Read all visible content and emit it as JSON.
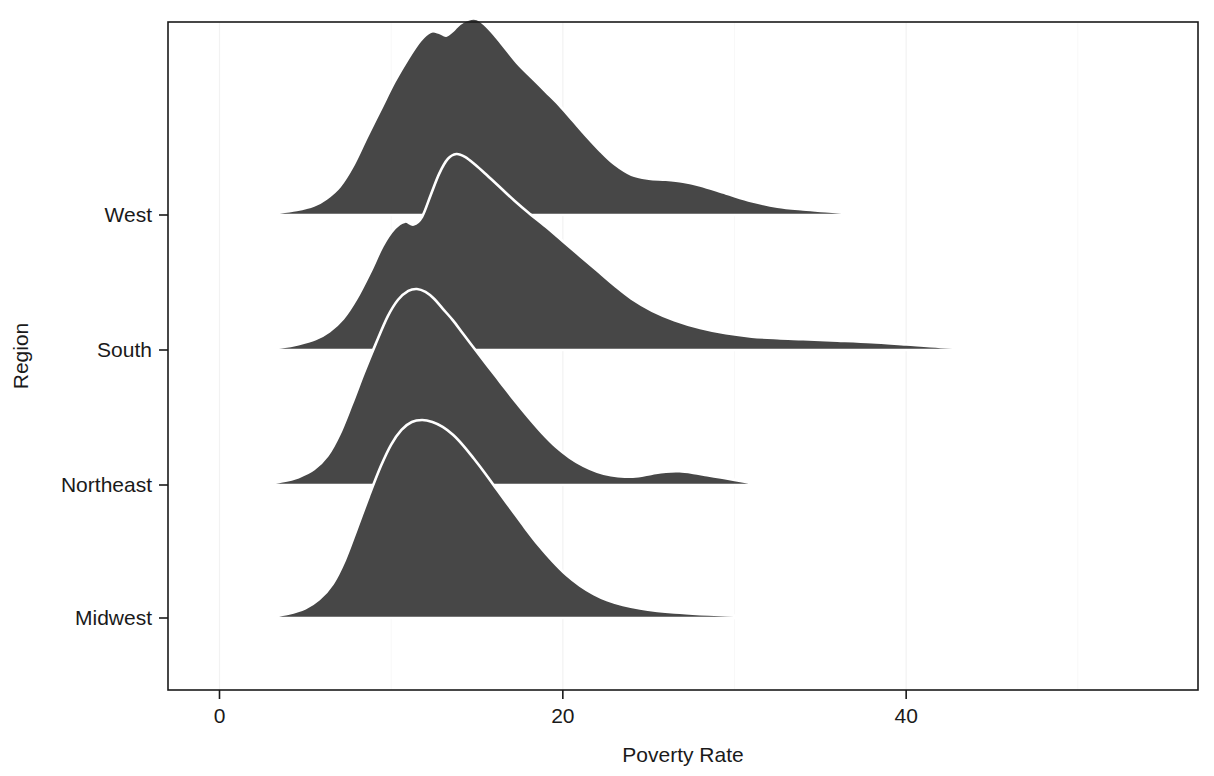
{
  "chart_data": {
    "type": "area",
    "subtype": "ridgeline-joyplot",
    "title": "",
    "xlabel": "Poverty Rate",
    "ylabel": "Region",
    "xlim": [
      -3,
      57
    ],
    "x_ticks": [
      0,
      20,
      40
    ],
    "x_tick_labels": [
      "0",
      "20",
      "40"
    ],
    "x_minor_ticks": [
      10,
      30,
      50
    ],
    "grid": "minor-light",
    "legend": "none",
    "categories": [
      "Midwest",
      "Northeast",
      "South",
      "West"
    ],
    "category_order_top_to_bottom": [
      "West",
      "South",
      "Northeast",
      "Midwest"
    ],
    "fill_color": "#474747",
    "line_color": "#ffffff",
    "background_color": "#ffffff",
    "panel_border_color": "#1a1a1a",
    "series": [
      {
        "name": "West",
        "x": [
          2.4,
          3.5,
          4.5,
          5.5,
          6.2,
          7.0,
          7.8,
          8.6,
          9.4,
          10.2,
          11.0,
          11.7,
          12.3,
          12.8,
          13.2,
          13.6,
          14.0,
          14.5,
          15.0,
          15.4,
          16.0,
          16.7,
          17.4,
          18.2,
          19.0,
          19.8,
          20.6,
          21.4,
          22.2,
          23.0,
          24.0,
          25.0,
          26.0,
          27.0,
          28.0,
          29.5,
          31.0,
          32.5,
          34.0,
          35.5,
          37.0
        ],
        "density": [
          0.006,
          0.013,
          0.025,
          0.048,
          0.082,
          0.145,
          0.255,
          0.4,
          0.54,
          0.68,
          0.8,
          0.89,
          0.935,
          0.93,
          0.915,
          0.94,
          0.975,
          0.998,
          1.0,
          0.975,
          0.92,
          0.845,
          0.77,
          0.7,
          0.63,
          0.56,
          0.48,
          0.4,
          0.325,
          0.26,
          0.205,
          0.185,
          0.18,
          0.17,
          0.15,
          0.11,
          0.07,
          0.042,
          0.028,
          0.018,
          0.008
        ],
        "peak_x": 15.3,
        "secondary_peak_x": 12.4,
        "tail_end_x": 37
      },
      {
        "name": "South",
        "x": [
          2.6,
          3.6,
          4.6,
          5.6,
          6.4,
          7.2,
          8.0,
          8.8,
          9.5,
          10.2,
          10.8,
          11.3,
          11.8,
          12.3,
          12.8,
          13.3,
          13.8,
          14.3,
          14.9,
          15.6,
          16.4,
          17.2,
          18.0,
          19.0,
          20.0,
          21.0,
          22.0,
          23.0,
          24.0,
          25.2,
          26.5,
          28.0,
          29.5,
          31.0,
          32.5,
          34.0,
          36.0,
          38.0,
          40.0,
          42.0,
          44.5
        ],
        "density": [
          0.005,
          0.014,
          0.03,
          0.056,
          0.095,
          0.16,
          0.265,
          0.4,
          0.53,
          0.62,
          0.655,
          0.64,
          0.68,
          0.79,
          0.9,
          0.975,
          1.0,
          0.985,
          0.945,
          0.89,
          0.825,
          0.76,
          0.7,
          0.63,
          0.555,
          0.48,
          0.405,
          0.33,
          0.262,
          0.2,
          0.152,
          0.112,
          0.085,
          0.068,
          0.06,
          0.055,
          0.048,
          0.04,
          0.028,
          0.016,
          0.006
        ],
        "peak_x": 13.9,
        "secondary_peak_x": 10.9,
        "tail_end_x": 44.5
      },
      {
        "name": "Northeast",
        "x": [
          2.6,
          3.6,
          4.6,
          5.5,
          6.3,
          7.0,
          7.7,
          8.4,
          9.1,
          9.8,
          10.4,
          11.0,
          11.5,
          12.0,
          12.5,
          13.0,
          13.6,
          14.2,
          14.9,
          15.6,
          16.4,
          17.2,
          18.0,
          18.8,
          19.6,
          20.4,
          21.2,
          22.0,
          22.8,
          23.6,
          24.4,
          25.2,
          26.0,
          26.8,
          27.6,
          28.4,
          29.2,
          30.0,
          31.0
        ],
        "density": [
          0.006,
          0.018,
          0.04,
          0.08,
          0.15,
          0.26,
          0.41,
          0.57,
          0.72,
          0.86,
          0.945,
          0.99,
          1.0,
          0.985,
          0.95,
          0.9,
          0.84,
          0.77,
          0.69,
          0.61,
          0.52,
          0.43,
          0.345,
          0.265,
          0.195,
          0.14,
          0.098,
          0.068,
          0.05,
          0.042,
          0.045,
          0.058,
          0.068,
          0.07,
          0.062,
          0.05,
          0.038,
          0.026,
          0.01
        ],
        "peak_x": 11.6,
        "secondary_peak_x": 26.8,
        "tail_end_x": 31
      },
      {
        "name": "Midwest",
        "x": [
          3.0,
          4.0,
          5.0,
          5.8,
          6.6,
          7.3,
          8.0,
          8.7,
          9.4,
          10.0,
          10.6,
          11.2,
          11.8,
          12.4,
          13.0,
          13.6,
          14.2,
          14.8,
          15.5,
          16.2,
          17.0,
          17.8,
          18.6,
          19.4,
          20.2,
          21.0,
          21.8,
          22.6,
          23.5,
          24.5,
          25.5,
          26.5,
          28.0,
          29.5,
          31.0,
          33.0,
          35.0
        ],
        "density": [
          0.008,
          0.022,
          0.05,
          0.095,
          0.175,
          0.295,
          0.455,
          0.62,
          0.775,
          0.885,
          0.96,
          1.0,
          1.01,
          1.0,
          0.975,
          0.935,
          0.88,
          0.815,
          0.735,
          0.65,
          0.555,
          0.46,
          0.37,
          0.29,
          0.22,
          0.165,
          0.122,
          0.09,
          0.066,
          0.048,
          0.036,
          0.028,
          0.02,
          0.014,
          0.01,
          0.006,
          0.003
        ],
        "peak_x": 11.9,
        "tail_end_x": 35
      }
    ]
  },
  "axes": {
    "x_title": "Poverty Rate",
    "y_title": "Region",
    "x_tick_labels": [
      "0",
      "20",
      "40"
    ],
    "y_tick_labels": [
      "West",
      "South",
      "Northeast",
      "Midwest"
    ]
  }
}
